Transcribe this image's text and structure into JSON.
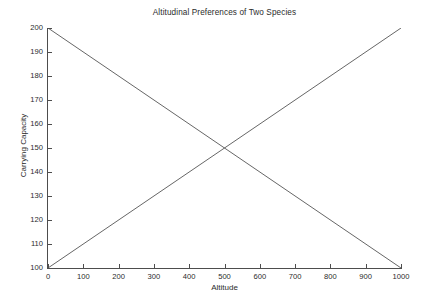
{
  "chart_data": {
    "type": "line",
    "title": "Altitudinal Preferences of Two Species",
    "xlabel": "Altitude",
    "ylabel": "Carrying Capacity",
    "xlim": [
      0,
      1000
    ],
    "ylim": [
      100,
      200
    ],
    "grid": false,
    "legend": null,
    "xticks": [
      0,
      100,
      200,
      300,
      400,
      500,
      600,
      700,
      800,
      900,
      1000
    ],
    "xticklabels": [
      "0",
      "100",
      "200",
      "300",
      "400",
      "500",
      "600",
      "700",
      "800",
      "900",
      "1000"
    ],
    "yticks": [
      100,
      110,
      120,
      130,
      140,
      150,
      160,
      170,
      180,
      190,
      200
    ],
    "yticklabels": [
      "100",
      "110",
      "120",
      "130",
      "140",
      "150",
      "160",
      "170",
      "180",
      "190",
      "200"
    ],
    "line_color": "#555555",
    "series": [
      {
        "name": "species-1-descending",
        "x": [
          0,
          1000
        ],
        "values": [
          200,
          100
        ]
      },
      {
        "name": "species-2-ascending",
        "x": [
          0,
          1000
        ],
        "values": [
          100,
          200
        ]
      }
    ],
    "intersection": {
      "x": 500,
      "y": 150
    }
  }
}
